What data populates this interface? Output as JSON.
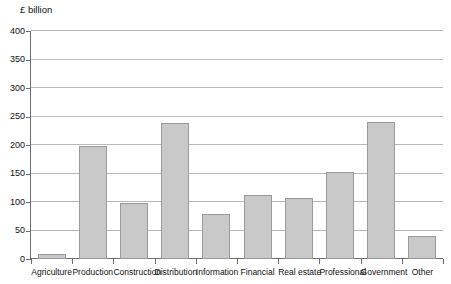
{
  "chart_data": {
    "type": "bar",
    "title": "",
    "subtitle": "",
    "xlabel": "",
    "ylabel": "£ billion",
    "ylim": [
      0,
      400
    ],
    "yticks": [
      0,
      50,
      100,
      150,
      200,
      250,
      300,
      350,
      400
    ],
    "ytick_labels": [
      "0",
      "50",
      "100",
      "150",
      "200",
      "250",
      "300",
      "350",
      "400"
    ],
    "grid": true,
    "legend": false,
    "legend_position": "none",
    "categories": [
      "Agriculture",
      "Production",
      "Construction",
      "Distribution",
      "Information",
      "Financial",
      "Real estate",
      "Professional",
      "Government",
      "Other"
    ],
    "values": [
      9,
      198,
      98,
      238,
      79,
      112,
      107,
      152,
      241,
      41
    ],
    "bar_color": "#c9c9c9",
    "bar_border_color": "#9a9a9a",
    "gridline_color": "#b9b9b9",
    "axis_color": "#6e6e6e",
    "background_color": "#ffffff"
  }
}
